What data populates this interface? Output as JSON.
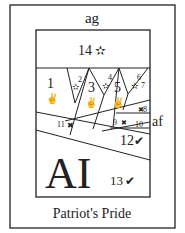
{
  "title": "Patriot's Pride",
  "labels": {
    "top": "ag",
    "right": "af"
  },
  "center_text": "AI",
  "pieces": [
    {
      "n": "1",
      "symbol": "victory-hand"
    },
    {
      "n": "2",
      "symbol": "star"
    },
    {
      "n": "3",
      "symbol": "victory-hand"
    },
    {
      "n": "4",
      "symbol": "star"
    },
    {
      "n": "5",
      "symbol": "victory-hand"
    },
    {
      "n": "6",
      "symbol": "star"
    },
    {
      "n": "7",
      "symbol": ""
    },
    {
      "n": "8",
      "symbol": "x"
    },
    {
      "n": "9",
      "symbol": "x"
    },
    {
      "n": "10",
      "symbol": "check"
    },
    {
      "n": "11",
      "symbol": "x"
    },
    {
      "n": "12",
      "symbol": "check"
    },
    {
      "n": "13",
      "symbol": "check"
    },
    {
      "n": "14",
      "symbol": "star"
    }
  ],
  "glyphs": {
    "star": "✫",
    "check": "✔",
    "x": "✖",
    "victory": "✌"
  }
}
